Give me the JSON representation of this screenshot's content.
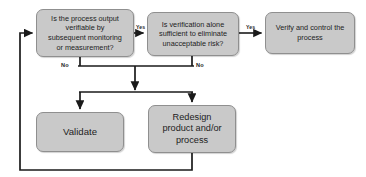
{
  "diagram": {
    "canvas": {
      "width": 366,
      "height": 177
    },
    "colors": {
      "node_fill": "#c9c9c9",
      "node_border": "#8f8f8f",
      "connector": "#1a1a1a",
      "text": "#1d1d1d",
      "background": "#ffffff"
    },
    "nodes": [
      {
        "id": "verifiable",
        "shape": "rounded-rectangle",
        "text": "Is the process output\nverifiable by\nsubsequent monitoring\nor measurement?",
        "type": "decision"
      },
      {
        "id": "verification-sufficient",
        "shape": "rounded-rectangle",
        "text": "Is verification alone\nsufficient to eliminate\nunacceptable risk?",
        "type": "decision"
      },
      {
        "id": "verify-control",
        "shape": "rounded-rectangle",
        "text": "Verify and control the\nprocess",
        "type": "action"
      },
      {
        "id": "validate",
        "shape": "rounded-rectangle",
        "text": "Validate",
        "type": "action"
      },
      {
        "id": "redesign",
        "shape": "rounded-rectangle",
        "text": "Redesign\nproduct and/or\nprocess",
        "type": "action"
      }
    ],
    "edge_labels": {
      "yes_1": "Yes",
      "yes_2": "Yes",
      "no_1": "No",
      "no_2": "No"
    },
    "edges": [
      {
        "from": "verifiable",
        "to": "verification-sufficient",
        "label": "Yes"
      },
      {
        "from": "verification-sufficient",
        "to": "verify-control",
        "label": "Yes"
      },
      {
        "from": "verifiable",
        "to": "validate",
        "label": "No"
      },
      {
        "from": "verifiable",
        "to": "redesign",
        "label": "No"
      },
      {
        "from": "verification-sufficient",
        "to": "validate",
        "label": "No"
      },
      {
        "from": "verification-sufficient",
        "to": "redesign",
        "label": "No"
      },
      {
        "from": "redesign",
        "to": "verifiable",
        "label": ""
      }
    ]
  }
}
